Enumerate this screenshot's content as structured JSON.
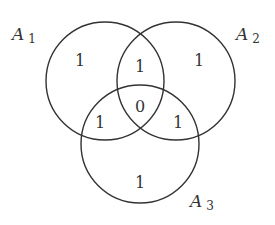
{
  "diagram": {
    "type": "venn",
    "sets": [
      {
        "name": "A",
        "subscript": "1"
      },
      {
        "name": "A",
        "subscript": "2"
      },
      {
        "name": "A",
        "subscript": "3"
      }
    ],
    "regions": {
      "a1_only": "1",
      "a2_only": "1",
      "a3_only": "1",
      "a1_a2": "1",
      "a1_a3": "1",
      "a2_a3": "1",
      "a1_a2_a3": "0"
    }
  }
}
